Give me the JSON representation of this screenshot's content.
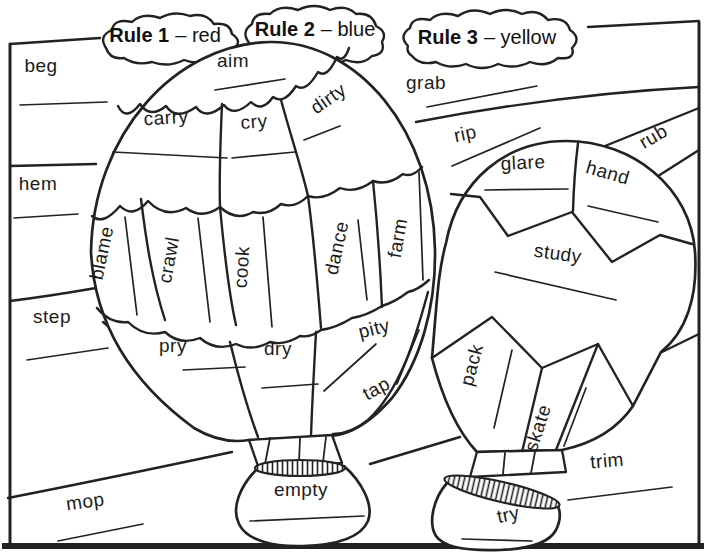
{
  "ink_color": "#222222",
  "paper_color": "#ffffff",
  "rules": [
    {
      "name": "Rule 1",
      "value": "– red"
    },
    {
      "name": "Rule 2",
      "value": "– blue"
    },
    {
      "name": "Rule 3",
      "value": "– yellow"
    }
  ],
  "large_balloon": {
    "top": "aim",
    "upper_band": [
      "carry",
      "cry",
      "dirty"
    ],
    "middle_band": [
      "blame",
      "crawl",
      "cook",
      "dance",
      "farm"
    ],
    "lower_band": [
      "pry",
      "dry",
      "pity",
      "tap"
    ],
    "basket": "empty"
  },
  "small_balloon": {
    "upper_band": [
      "glare",
      "hand"
    ],
    "middle": "study",
    "lower_band": [
      "pack",
      "skate"
    ],
    "basket": "try"
  },
  "background_words": [
    "beg",
    "hem",
    "step",
    "mop",
    "grab",
    "rip",
    "rub",
    "trim"
  ]
}
